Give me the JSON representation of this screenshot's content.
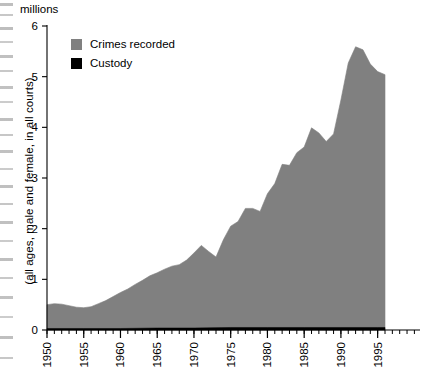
{
  "chart_data": {
    "type": "area",
    "title": "",
    "units_label": "millions",
    "ylabel": "(all ages, male and female, in all courts)",
    "xlabel": "",
    "ylim": [
      0,
      6
    ],
    "xlim": [
      1950,
      1996
    ],
    "y_ticks": [
      0,
      1,
      2,
      3,
      4,
      5,
      6
    ],
    "x_ticks": [
      1950,
      1955,
      1960,
      1965,
      1970,
      1975,
      1980,
      1985,
      1990,
      1995
    ],
    "x_minor_tick_interval": 1,
    "grid": false,
    "legend_position": "top-left",
    "colors": {
      "crimes_recorded": "#808080",
      "custody": "#000000",
      "axis": "#000000",
      "background": "#ffffff"
    },
    "series": [
      {
        "name": "Crimes recorded",
        "color": "#808080",
        "x": [
          1950,
          1951,
          1952,
          1953,
          1954,
          1955,
          1956,
          1957,
          1958,
          1959,
          1960,
          1961,
          1962,
          1963,
          1964,
          1965,
          1966,
          1967,
          1968,
          1969,
          1970,
          1971,
          1972,
          1973,
          1974,
          1975,
          1976,
          1977,
          1978,
          1979,
          1980,
          1981,
          1982,
          1983,
          1984,
          1985,
          1986,
          1987,
          1988,
          1989,
          1990,
          1991,
          1992,
          1993,
          1994,
          1995,
          1996
        ],
        "values": [
          0.5,
          0.52,
          0.51,
          0.48,
          0.45,
          0.44,
          0.46,
          0.52,
          0.58,
          0.66,
          0.74,
          0.81,
          0.9,
          0.98,
          1.07,
          1.13,
          1.2,
          1.26,
          1.29,
          1.38,
          1.52,
          1.67,
          1.55,
          1.44,
          1.78,
          2.05,
          2.14,
          2.4,
          2.4,
          2.34,
          2.69,
          2.89,
          3.27,
          3.25,
          3.5,
          3.61,
          3.99,
          3.89,
          3.72,
          3.87,
          4.54,
          5.27,
          5.59,
          5.53,
          5.25,
          5.1,
          5.04
        ]
      },
      {
        "name": "Custody",
        "color": "#000000",
        "x": [
          1950,
          1955,
          1960,
          1965,
          1970,
          1975,
          1980,
          1985,
          1990,
          1995,
          1996
        ],
        "values": [
          0.03,
          0.03,
          0.03,
          0.04,
          0.04,
          0.05,
          0.05,
          0.05,
          0.05,
          0.05,
          0.05
        ]
      }
    ]
  },
  "legend": {
    "items": [
      {
        "label": "Crimes recorded",
        "color": "#808080"
      },
      {
        "label": "Custody",
        "color": "#000000"
      }
    ]
  },
  "axes": {
    "units": "millions",
    "y_caption": "(all ages, male and female, in all courts)"
  }
}
